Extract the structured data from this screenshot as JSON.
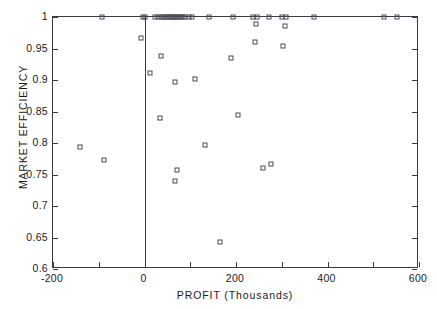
{
  "chart_data": {
    "type": "scatter",
    "title": "",
    "xlabel": "PROFIT (Thousands)",
    "ylabel": "MARKET EFFICIENCY",
    "xlim": [
      -200,
      600
    ],
    "ylim": [
      0.6,
      1.0
    ],
    "grid": false,
    "legend": false,
    "marker_style": "open-square",
    "xticks": [
      -200,
      0,
      200,
      400,
      600
    ],
    "xtick_labels": [
      "-200",
      "0",
      "200",
      "400",
      "600"
    ],
    "xminor_ticks": [
      -100,
      100,
      300,
      500
    ],
    "yticks": [
      0.6,
      0.65,
      0.7,
      0.75,
      0.8,
      0.85,
      0.9,
      0.95,
      1
    ],
    "ytick_labels": [
      "0.6",
      "0.65",
      "0.7",
      "0.75",
      "0.8",
      "0.85",
      "0.9",
      "0.95",
      "1"
    ],
    "reference_line": {
      "orientation": "vertical",
      "x": 0
    },
    "series": [
      {
        "name": "firms",
        "points": [
          [
            -92,
            1.0
          ],
          [
            -3,
            1.0
          ],
          [
            2,
            1.0
          ],
          [
            22,
            1.0
          ],
          [
            30,
            1.0
          ],
          [
            36,
            1.0
          ],
          [
            41,
            1.0
          ],
          [
            45,
            1.0
          ],
          [
            49,
            1.0
          ],
          [
            53,
            1.0
          ],
          [
            57,
            1.0
          ],
          [
            61,
            1.0
          ],
          [
            64,
            1.0
          ],
          [
            68,
            1.0
          ],
          [
            72,
            1.0
          ],
          [
            76,
            1.0
          ],
          [
            80,
            1.0
          ],
          [
            84,
            1.0
          ],
          [
            88,
            1.0
          ],
          [
            97,
            1.0
          ],
          [
            104,
            1.0
          ],
          [
            140,
            1.0
          ],
          [
            193,
            1.0
          ],
          [
            238,
            1.0
          ],
          [
            246,
            1.0
          ],
          [
            272,
            1.0
          ],
          [
            300,
            1.0
          ],
          [
            310,
            1.0
          ],
          [
            370,
            1.0
          ],
          [
            524,
            1.0
          ],
          [
            551,
            1.0
          ],
          [
            243,
            0.989
          ],
          [
            307,
            0.986
          ],
          [
            -7,
            0.966
          ],
          [
            241,
            0.96
          ],
          [
            302,
            0.954
          ],
          [
            36,
            0.938
          ],
          [
            188,
            0.935
          ],
          [
            13,
            0.911
          ],
          [
            110,
            0.902
          ],
          [
            66,
            0.897
          ],
          [
            205,
            0.845
          ],
          [
            33,
            0.839
          ],
          [
            133,
            0.797
          ],
          [
            -141,
            0.793
          ],
          [
            -88,
            0.773
          ],
          [
            277,
            0.767
          ],
          [
            258,
            0.761
          ],
          [
            72,
            0.757
          ],
          [
            66,
            0.74
          ],
          [
            164,
            0.643
          ]
        ]
      }
    ]
  }
}
